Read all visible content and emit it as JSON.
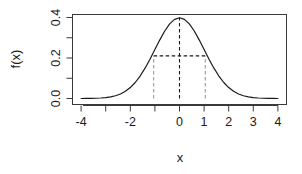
{
  "chart_data": {
    "type": "line",
    "title": "",
    "subtitle": "",
    "xlabel": "x",
    "ylabel": "f(x)",
    "xlim": [
      -4.35,
      4.35
    ],
    "ylim": [
      0.0,
      0.4
    ],
    "grid": false,
    "legend": null,
    "box": true,
    "curve_label": "standard normal density",
    "x_ticks": [
      -4,
      -3,
      -2,
      -1,
      0,
      1,
      2,
      3,
      4
    ],
    "x_tick_labels": [
      "-4",
      "",
      "-2",
      "",
      "0",
      "1",
      "2",
      "3",
      "4"
    ],
    "y_ticks": [
      0.0,
      0.1,
      0.2,
      0.3,
      0.4
    ],
    "y_tick_labels": [
      "0.0",
      "",
      "0.2",
      "",
      "0.4"
    ],
    "x": [
      -4.0,
      -3.8,
      -3.6,
      -3.4,
      -3.2,
      -3.0,
      -2.8,
      -2.6,
      -2.4,
      -2.2,
      -2.0,
      -1.8,
      -1.6,
      -1.4,
      -1.2,
      -1.0,
      -0.8,
      -0.6,
      -0.4,
      -0.2,
      0.0,
      0.2,
      0.4,
      0.6,
      0.8,
      1.0,
      1.2,
      1.4,
      1.6,
      1.8,
      2.0,
      2.2,
      2.4,
      2.6,
      2.8,
      3.0,
      3.2,
      3.4,
      3.6,
      3.8,
      4.0
    ],
    "y": [
      0.0001,
      0.0003,
      0.0006,
      0.0012,
      0.0024,
      0.0044,
      0.0079,
      0.0136,
      0.0224,
      0.0355,
      0.054,
      0.079,
      0.1109,
      0.1497,
      0.1942,
      0.242,
      0.2897,
      0.3332,
      0.3683,
      0.391,
      0.3989,
      0.391,
      0.3683,
      0.3332,
      0.2897,
      0.242,
      0.1942,
      0.1497,
      0.1109,
      0.079,
      0.054,
      0.0355,
      0.0224,
      0.0136,
      0.0079,
      0.0044,
      0.0024,
      0.0012,
      0.0006,
      0.0003,
      0.0001
    ],
    "annotations": [
      {
        "name": "mean-vline",
        "type": "vline",
        "x": 0.0,
        "y_from": 0.0,
        "y_to": 0.3989,
        "style": "dashed",
        "color": "#1a1a1a"
      },
      {
        "name": "left-sd-vline",
        "type": "vline",
        "x": -1.05,
        "y_from": 0.0,
        "y_to": 0.2105,
        "style": "dashed",
        "color": "#9a9a9a"
      },
      {
        "name": "right-sd-vline",
        "type": "vline",
        "x": 1.05,
        "y_from": 0.0,
        "y_to": 0.2105,
        "style": "dashed",
        "color": "#9a9a9a"
      },
      {
        "name": "sd-hline",
        "type": "hline",
        "y": 0.2105,
        "x_from": -1.05,
        "x_to": 1.05,
        "style": "dashed",
        "color": "#1a1a1a"
      }
    ]
  }
}
